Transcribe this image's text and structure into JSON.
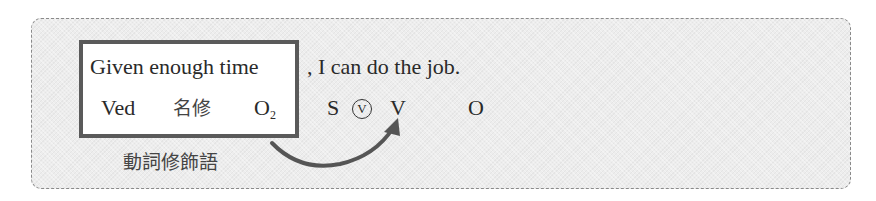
{
  "sentence": {
    "phrase": "Given enough time",
    "rest": ", I can do the job."
  },
  "labels": {
    "ved": "Ved",
    "noun_mod": "名修",
    "o2_base": "O",
    "o2_sub": "2",
    "s": "S",
    "aux_v_circled": "V",
    "v": "V",
    "o": "O"
  },
  "annotation": "動詞修飾語",
  "colors": {
    "box_border": "#5a5a5a",
    "arrow": "#555555",
    "panel_border": "#8a8a8a",
    "panel_bg": "#ededed"
  }
}
